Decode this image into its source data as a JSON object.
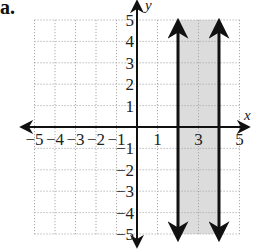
{
  "part_label": "a.",
  "chart_data": {
    "type": "inequality-graph",
    "title": "",
    "xlabel": "x",
    "ylabel": "y",
    "xlim": [
      -5,
      5
    ],
    "ylim": [
      -5,
      5
    ],
    "grid": true,
    "grid_style": "dotted",
    "x_tick_labels": [
      "−5",
      "−4",
      "−3",
      "−2",
      "−1",
      "1",
      "3",
      "5"
    ],
    "x_tick_values": [
      -5,
      -4,
      -3,
      -2,
      -1,
      1,
      3,
      5
    ],
    "y_tick_labels": [
      "5",
      "4",
      "3",
      "2",
      "1",
      "−1",
      "−2",
      "−3",
      "−4",
      "−5"
    ],
    "y_tick_values": [
      5,
      4,
      3,
      2,
      1,
      -1,
      -2,
      -3,
      -4,
      -5
    ],
    "boundary_lines": [
      {
        "equation": "x = 2",
        "x": 2,
        "style": "solid"
      },
      {
        "equation": "x = 4",
        "x": 4,
        "style": "solid"
      }
    ],
    "shaded_region": {
      "x_from": 2,
      "x_to": 4,
      "y_from": -5,
      "y_to": 5
    },
    "colors": {
      "shade": "#dcdcdc",
      "line": "#111111",
      "grid": "#aaaaaa"
    }
  }
}
